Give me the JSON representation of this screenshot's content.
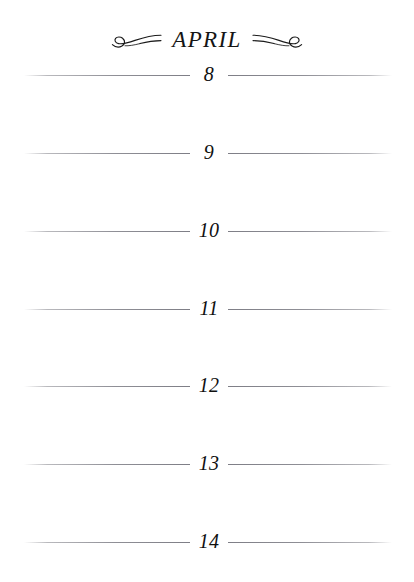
{
  "page": {
    "background_color": "#ffffff",
    "ink_color": "#101010",
    "rule_color": "#8f8f96"
  },
  "header": {
    "month_label": "APRIL",
    "left_ornament": "flourish-swirl-left-icon",
    "right_ornament": "flourish-swirl-right-icon"
  },
  "days": [
    {
      "number": "8",
      "top": 61
    },
    {
      "number": "9",
      "top": 139
    },
    {
      "number": "10",
      "top": 217
    },
    {
      "number": "11",
      "top": 295
    },
    {
      "number": "12",
      "top": 372
    },
    {
      "number": "13",
      "top": 450
    },
    {
      "number": "14",
      "top": 528
    }
  ]
}
